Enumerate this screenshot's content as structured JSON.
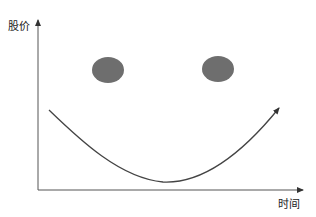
{
  "diagram": {
    "y_axis_label": "股价",
    "x_axis_label": "时间",
    "elements": {
      "left_eye": {
        "cx": 108,
        "cy": 70,
        "rx": 16,
        "ry": 13,
        "color": "#6e6e6e"
      },
      "right_eye": {
        "cx": 218,
        "cy": 69,
        "rx": 16,
        "ry": 13,
        "color": "#6e6e6e"
      },
      "smile_curve": {
        "start": [
          49,
          110
        ],
        "bottom": [
          163,
          182
        ],
        "end": [
          279,
          108
        ]
      }
    },
    "colors": {
      "axis": "#555555",
      "curve": "#444444",
      "eyes": "#6e6e6e"
    }
  }
}
